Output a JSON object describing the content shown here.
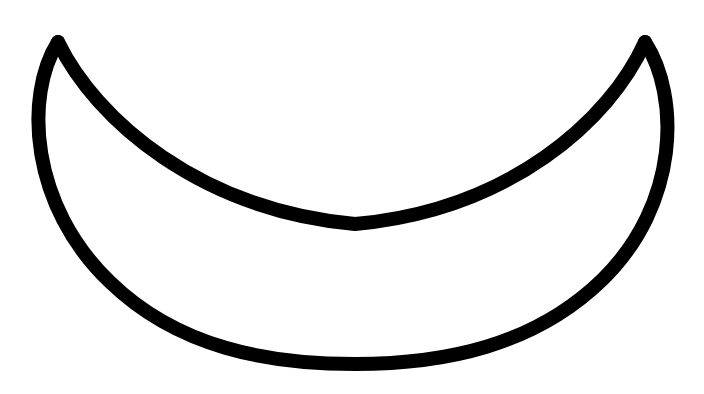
{
  "canvas": {
    "width": 704,
    "height": 394,
    "background_color": "#ffffff",
    "title": "Crescent outline drawing"
  },
  "figure": {
    "name": "crescent-outline",
    "stroke_color": "#000000",
    "fill_color": "none",
    "stroke_width": 14,
    "stroke_linecap": "round",
    "stroke_linejoin": "round"
  },
  "chart_data": {
    "type": "line",
    "xlabel": "",
    "ylabel": "",
    "grid": false,
    "legend": "none",
    "xlim": [
      0,
      704
    ],
    "ylim": [
      394,
      0
    ],
    "series": [
      {
        "name": "inner-arc",
        "note": "Upper/inner concave arc running left cusp to right cusp, dipping to its lowest point near the horizontal centre",
        "x": [
          58,
          110,
          165,
          225,
          285,
          355,
          425,
          485,
          545,
          595,
          645
        ],
        "y": [
          42,
          88,
          130,
          168,
          200,
          224,
          200,
          168,
          128,
          86,
          42
        ]
      },
      {
        "name": "outer-arc",
        "note": "Lower/outer convex arc running left cusp down around the bottom and back up to the right cusp",
        "x": [
          58,
          38,
          34,
          48,
          80,
          130,
          200,
          280,
          355,
          430,
          505,
          575,
          625,
          658,
          670,
          664,
          645
        ],
        "y": [
          42,
          78,
          122,
          170,
          218,
          264,
          308,
          344,
          362,
          344,
          310,
          264,
          216,
          166,
          120,
          78,
          42
        ]
      }
    ],
    "key_points": {
      "left_cusp": [
        58,
        42
      ],
      "right_cusp": [
        645,
        42
      ],
      "inner_arc_lowest": [
        355,
        224
      ],
      "outer_arc_lowest": [
        355,
        362
      ],
      "outer_leftmost": [
        34,
        122
      ],
      "outer_rightmost": [
        670,
        120
      ]
    }
  },
  "paths": {
    "inner_arc_d": "M 58 42 C 96 120 200 210 355 224 C 510 210 610 120 645 42",
    "outer_arc_d": "M 58 42 C 24 96 30 206 110 282 C 178 348 268 364 355 364 C 444 364 534 346 602 280 C 680 204 680 96 645 42"
  }
}
